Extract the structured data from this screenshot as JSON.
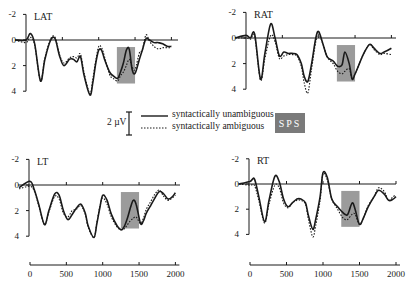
{
  "chart_data": {
    "type": "line",
    "title": "",
    "xlabel": "",
    "ylabel": "",
    "x_ticks": [
      0,
      500,
      1000,
      1500,
      2000
    ],
    "xlim": [
      0,
      2000
    ],
    "y_ticks": [
      -2,
      0,
      2,
      4
    ],
    "ylim": [
      -2,
      4
    ],
    "y_inverted": true,
    "legend": {
      "entries": [
        {
          "label": "syntactically unambiguous",
          "style": "solid"
        },
        {
          "label": "syntactically ambiguous",
          "style": "dotted"
        }
      ],
      "calibration": "2 µV",
      "shading_label": "SPS"
    },
    "shaded_window_ms": [
      1250,
      1500
    ],
    "panels": [
      {
        "name": "LAT",
        "series": [
          {
            "name": "syntactically unambiguous",
            "x": [
              -150,
              0,
              60,
              120,
              200,
              260,
              340,
              400,
              460,
              520,
              600,
              650,
              700,
              750,
              800,
              880,
              920,
              960,
              1000,
              1040,
              1080,
              1150,
              1200,
              1260,
              1300,
              1340,
              1380,
              1420,
              1460,
              1500,
              1560,
              1600,
              1650,
              1700,
              1760,
              1820,
              1880,
              1950,
              2000
            ],
            "y": [
              0,
              0,
              -0.5,
              0.3,
              3.2,
              1.5,
              0,
              -0.1,
              1.2,
              2.0,
              1.5,
              1.5,
              1.7,
              1.3,
              2.8,
              4.3,
              3.3,
              1.8,
              0.8,
              0.8,
              1.5,
              2.5,
              2.8,
              3.0,
              2.5,
              1.8,
              0.8,
              0.7,
              2.3,
              2.6,
              1.5,
              0.8,
              -0.1,
              0,
              0.2,
              0.2,
              0.3,
              0.5,
              0.5
            ]
          },
          {
            "name": "syntactically ambiguous",
            "x": [
              -150,
              0,
              60,
              120,
              200,
              260,
              340,
              400,
              460,
              520,
              600,
              650,
              700,
              750,
              800,
              880,
              920,
              960,
              1000,
              1040,
              1080,
              1150,
              1200,
              1260,
              1300,
              1340,
              1380,
              1420,
              1460,
              1500,
              1560,
              1600,
              1650,
              1700,
              1760,
              1820,
              1880,
              1950,
              2000
            ],
            "y": [
              0,
              0.2,
              -0.2,
              0.4,
              3.2,
              1.4,
              -0.1,
              -0.2,
              1.1,
              1.8,
              1.4,
              1.3,
              1.4,
              1.1,
              2.6,
              4.2,
              3.0,
              1.6,
              0.5,
              0.6,
              1.3,
              2.7,
              3.0,
              3.2,
              2.8,
              2.5,
              2.0,
              1.5,
              2.1,
              2.3,
              1.0,
              0.8,
              -0.4,
              0.1,
              0.5,
              0.7,
              0.6,
              0.6,
              0.6
            ]
          }
        ]
      },
      {
        "name": "RAT",
        "series": [
          {
            "name": "syntactically unambiguous",
            "x": [
              -150,
              0,
              60,
              120,
              200,
              260,
              340,
              400,
              460,
              520,
              580,
              640,
              700,
              760,
              800,
              850,
              900,
              960,
              1000,
              1060,
              1120,
              1200,
              1260,
              1320,
              1360,
              1420,
              1460,
              1500,
              1560,
              1620,
              1700,
              1760,
              1840,
              1900,
              2000
            ],
            "y": [
              0,
              -0.2,
              0,
              -0.3,
              3.2,
              1.2,
              -1.1,
              0,
              1.4,
              1.1,
              1.2,
              1.2,
              1.3,
              2.0,
              3.0,
              3.4,
              2.1,
              0,
              -0.5,
              0.5,
              1.5,
              1.8,
              2.2,
              2.1,
              1.1,
              2.0,
              3.2,
              2.8,
              2.0,
              1.2,
              0.5,
              0.8,
              1.2,
              1.1,
              0.8
            ]
          },
          {
            "name": "syntactically ambiguous",
            "x": [
              -150,
              0,
              60,
              120,
              200,
              260,
              340,
              400,
              460,
              520,
              580,
              640,
              700,
              760,
              800,
              850,
              900,
              960,
              1000,
              1060,
              1120,
              1200,
              1260,
              1320,
              1360,
              1420,
              1460,
              1500,
              1560,
              1620,
              1700,
              1760,
              1840,
              1900,
              2000
            ],
            "y": [
              0,
              0,
              0.1,
              -0.1,
              3.3,
              1.6,
              -0.2,
              0.3,
              1.6,
              1.4,
              1.3,
              1.3,
              1.4,
              2.2,
              3.5,
              4.3,
              2.5,
              0.3,
              -0.3,
              0.5,
              1.5,
              2.0,
              2.6,
              2.8,
              2.6,
              2.4,
              3.2,
              2.8,
              2.0,
              1.2,
              0.5,
              0.9,
              1.3,
              1.2,
              1.3
            ]
          }
        ]
      },
      {
        "name": "LT",
        "series": [
          {
            "name": "syntactically unambiguous",
            "x": [
              -150,
              0,
              60,
              120,
              200,
              260,
              340,
              400,
              460,
              520,
              580,
              640,
              700,
              760,
              800,
              880,
              920,
              960,
              1000,
              1060,
              1120,
              1200,
              1260,
              1300,
              1340,
              1380,
              1420,
              1460,
              1520,
              1560,
              1600,
              1660,
              1720,
              1780,
              1840,
              1900,
              1960,
              2000
            ],
            "y": [
              0.2,
              -0.3,
              0.4,
              1.5,
              3.1,
              2.0,
              0.7,
              0.8,
              2.0,
              2.7,
              2.3,
              1.8,
              1.5,
              2.2,
              3.2,
              4.1,
              3.0,
              1.8,
              0.8,
              1.2,
              2.3,
              3.2,
              3.5,
              3.2,
              2.6,
              1.8,
              1.2,
              1.5,
              3.0,
              2.8,
              2.2,
              1.6,
              1.0,
              0.5,
              0.7,
              1.1,
              0.9,
              0.6
            ]
          },
          {
            "name": "syntactically ambiguous",
            "x": [
              -150,
              0,
              60,
              120,
              200,
              260,
              340,
              400,
              460,
              520,
              580,
              640,
              700,
              760,
              800,
              880,
              920,
              960,
              1000,
              1060,
              1120,
              1200,
              1260,
              1300,
              1340,
              1380,
              1420,
              1460,
              1520,
              1560,
              1600,
              1660,
              1720,
              1780,
              1840,
              1900,
              1960,
              2000
            ],
            "y": [
              0.3,
              0.1,
              0.5,
              1.6,
              3.1,
              2.1,
              0.9,
              1.1,
              2.2,
              2.5,
              2.0,
              1.9,
              1.6,
              2.3,
              3.3,
              4.1,
              2.9,
              1.7,
              1.0,
              1.5,
              2.5,
              3.3,
              3.5,
              3.4,
              3.1,
              2.8,
              2.6,
              2.5,
              3.0,
              2.6,
              1.9,
              1.3,
              0.7,
              0.4,
              0.9,
              1.2,
              1.0,
              0.8
            ]
          }
        ]
      },
      {
        "name": "RT",
        "series": [
          {
            "name": "syntactically unambiguous",
            "x": [
              -150,
              0,
              60,
              120,
              200,
              260,
              340,
              400,
              460,
              520,
              580,
              640,
              700,
              760,
              800,
              860,
              900,
              960,
              1000,
              1060,
              1120,
              1200,
              1260,
              1300,
              1340,
              1400,
              1440,
              1500,
              1560,
              1620,
              1700,
              1760,
              1840,
              1900,
              1960,
              2000
            ],
            "y": [
              0,
              -0.2,
              -0.4,
              1.0,
              3.0,
              1.3,
              -0.6,
              -0.2,
              1.2,
              1.8,
              1.5,
              1.2,
              1.2,
              1.5,
              2.5,
              3.6,
              2.8,
              1.0,
              -0.9,
              -0.5,
              1.2,
              1.8,
              2.2,
              2.4,
              2.4,
              1.5,
              2.0,
              3.2,
              2.6,
              1.8,
              1.0,
              0.5,
              0.8,
              1.3,
              1.2,
              1.0
            ]
          },
          {
            "name": "syntactically ambiguous",
            "x": [
              -150,
              0,
              60,
              120,
              200,
              260,
              340,
              400,
              460,
              520,
              580,
              640,
              700,
              760,
              800,
              860,
              900,
              960,
              1000,
              1060,
              1120,
              1200,
              1260,
              1300,
              1340,
              1400,
              1440,
              1500,
              1560,
              1620,
              1700,
              1760,
              1840,
              1900,
              1960,
              2000
            ],
            "y": [
              0,
              0.1,
              0.1,
              1.3,
              3.1,
              1.6,
              0.1,
              0.3,
              1.5,
              1.9,
              1.5,
              1.3,
              1.3,
              1.6,
              2.8,
              4.2,
              3.3,
              1.3,
              -0.8,
              -0.3,
              1.2,
              2.0,
              2.6,
              2.8,
              2.8,
              2.4,
              2.4,
              3.2,
              2.6,
              1.7,
              1.0,
              0.3,
              0.6,
              1.3,
              1.0,
              0.9
            ]
          }
        ]
      }
    ]
  },
  "legend": {
    "calibration": "2 µV",
    "solid_label": "syntactically unambiguous",
    "dotted_label": "syntactically ambiguous",
    "sps_label": "SPS"
  },
  "panels": {
    "LAT": {
      "label": "LAT"
    },
    "RAT": {
      "label": "RAT"
    },
    "LT": {
      "label": "LT"
    },
    "RT": {
      "label": "RT"
    }
  },
  "y_tick_labels": [
    "-2",
    "0",
    "2",
    "4"
  ],
  "x_tick_labels": [
    "0",
    "500",
    "1000",
    "1500",
    "2000"
  ],
  "colors": {
    "line": "#1a1a1a",
    "shading": "#8a8a8a",
    "sps_box": "#7a7a7a"
  }
}
